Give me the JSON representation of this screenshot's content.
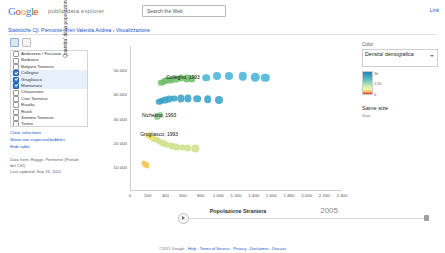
{
  "header": {
    "logo_text": "Google",
    "logo_sub": "public data explorer",
    "search_button": "Search the Web",
    "top_right_link": "Link"
  },
  "breadcrumb": {
    "part1": "Statistiche Cjl: Piemonte, Tren Valentia Andrea",
    "sep": " › ",
    "part2": "Visualizzazione"
  },
  "left_panel": {
    "tools": [
      "grid-view-button",
      "list-view-button"
    ],
    "items": [
      {
        "label": "Andezeno / Fossano",
        "checked": false
      },
      {
        "label": "Barbania",
        "checked": false
      },
      {
        "label": "Bolgaro Torinese",
        "checked": false
      },
      {
        "label": "Collegno",
        "checked": true
      },
      {
        "label": "Grugliasco",
        "checked": true
      },
      {
        "label": "Montanaro",
        "checked": true
      },
      {
        "label": "Chiaverano",
        "checked": false
      },
      {
        "label": "Cirie Torinese",
        "checked": false
      },
      {
        "label": "Rivalta",
        "checked": false
      },
      {
        "label": "Rivoli",
        "checked": false
      },
      {
        "label": "Settimo Torinese",
        "checked": false
      },
      {
        "label": "Torino",
        "checked": false
      },
      {
        "label": "Venaria",
        "checked": false
      }
    ],
    "links": [
      "Clear selections",
      "Show non expected bubbles",
      "Hide table"
    ],
    "data_note_lines": [
      "Data from: Rogge, Piemonte (Portale",
      "del CSI)",
      "Last updated: Sep 16, 2011"
    ]
  },
  "right_panel": {
    "color_label": "Color",
    "selected_metric": "Densita' demografica",
    "legend_min": "0",
    "legend_mid": "1.5k",
    "legend_max": "3k",
    "size_label": "Same size",
    "size_sub": "Size"
  },
  "timeline": {
    "year": "2005",
    "play_button": "play-button"
  },
  "footer": {
    "text": "©2011 Google -",
    "links": [
      "Help",
      "Terms of Service",
      "Privacy",
      "Disclaimer",
      "Discuss"
    ]
  },
  "chart_data": {
    "type": "scatter",
    "title": "",
    "xlabel": "Popolazione Straniera",
    "ylabel": "Quantita' della popolazione totale per comune",
    "xlim": [
      0,
      2400
    ],
    "ylim": [
      0,
      60000
    ],
    "xticks": [
      "0",
      "200",
      "400",
      "600",
      "800",
      "1.000",
      "1.200",
      "1.400",
      "1.600",
      "1.800",
      "2.000",
      "2.200",
      "2.400"
    ],
    "yticks": [
      "10.000",
      "20.000",
      "30.000",
      "40.000",
      "50.000"
    ],
    "grid": false,
    "legend_position": "right",
    "color_scale": "Densita' demografica",
    "annotations": [
      {
        "text": "Collegno, 1993",
        "x": 600,
        "y": 47000
      },
      {
        "text": "Nichelino, 1993",
        "x": 330,
        "y": 31500
      },
      {
        "text": "Grugliasco, 1993",
        "x": 330,
        "y": 23500
      }
    ],
    "series": [
      {
        "name": "Collegno",
        "color": "#6fbf6a",
        "points": [
          {
            "x": 355,
            "y": 44800,
            "r": 3.2
          },
          {
            "x": 380,
            "y": 45200,
            "r": 3.2
          },
          {
            "x": 400,
            "y": 45600,
            "r": 3.2
          },
          {
            "x": 430,
            "y": 45800,
            "r": 3.4
          },
          {
            "x": 470,
            "y": 46000,
            "r": 3.4
          },
          {
            "x": 520,
            "y": 46400,
            "r": 3.4
          },
          {
            "x": 575,
            "y": 46700,
            "r": 3.6
          },
          {
            "x": 640,
            "y": 46600,
            "r": 3.6
          },
          {
            "x": 700,
            "y": 46400,
            "r": 3.6
          }
        ]
      },
      {
        "name": "Collegno-late",
        "color": "#49b5d6",
        "points": [
          {
            "x": 860,
            "y": 46900,
            "r": 3.8
          },
          {
            "x": 980,
            "y": 47400,
            "r": 4.0
          },
          {
            "x": 1120,
            "y": 47500,
            "r": 4.0
          },
          {
            "x": 1280,
            "y": 47400,
            "r": 4.2
          },
          {
            "x": 1420,
            "y": 47100,
            "r": 4.2
          },
          {
            "x": 1530,
            "y": 46900,
            "r": 4.2
          }
        ]
      },
      {
        "name": "Nichelino",
        "color": "#3aa3c8",
        "points": [
          {
            "x": 330,
            "y": 36800,
            "r": 3.2
          },
          {
            "x": 360,
            "y": 37200,
            "r": 3.2
          },
          {
            "x": 395,
            "y": 37600,
            "r": 3.4
          },
          {
            "x": 440,
            "y": 38000,
            "r": 3.4
          },
          {
            "x": 500,
            "y": 38200,
            "r": 3.4
          },
          {
            "x": 575,
            "y": 38300,
            "r": 3.6
          },
          {
            "x": 660,
            "y": 38300,
            "r": 3.6
          },
          {
            "x": 760,
            "y": 38200,
            "r": 3.8
          },
          {
            "x": 880,
            "y": 38000,
            "r": 3.8
          },
          {
            "x": 1010,
            "y": 37800,
            "r": 4.0
          }
        ]
      },
      {
        "name": "Nichelino-low",
        "color": "#8fcf8a",
        "points": [
          {
            "x": 300,
            "y": 30600,
            "r": 3.0
          },
          {
            "x": 320,
            "y": 31000,
            "r": 3.0
          },
          {
            "x": 345,
            "y": 31400,
            "r": 3.0
          }
        ]
      },
      {
        "name": "Grugliasco",
        "color": "#cfe08a",
        "points": [
          {
            "x": 270,
            "y": 21500,
            "r": 3.0
          },
          {
            "x": 300,
            "y": 21000,
            "r": 3.0
          },
          {
            "x": 335,
            "y": 20400,
            "r": 3.2
          },
          {
            "x": 375,
            "y": 19800,
            "r": 3.2
          },
          {
            "x": 420,
            "y": 19200,
            "r": 3.2
          },
          {
            "x": 470,
            "y": 18700,
            "r": 3.4
          },
          {
            "x": 525,
            "y": 18300,
            "r": 3.4
          },
          {
            "x": 590,
            "y": 18000,
            "r": 3.4
          },
          {
            "x": 660,
            "y": 17800,
            "r": 3.6
          },
          {
            "x": 740,
            "y": 17600,
            "r": 3.6
          }
        ]
      },
      {
        "name": "Grugliasco-tail",
        "color": "#f2e06a",
        "points": [
          {
            "x": 200,
            "y": 23200,
            "r": 2.8
          },
          {
            "x": 225,
            "y": 22600,
            "r": 2.8
          },
          {
            "x": 250,
            "y": 22100,
            "r": 2.8
          }
        ]
      },
      {
        "name": "Montanaro",
        "color": "#f5c85a",
        "points": [
          {
            "x": 160,
            "y": 11500,
            "r": 2.6
          },
          {
            "x": 175,
            "y": 11000,
            "r": 2.6
          },
          {
            "x": 190,
            "y": 10600,
            "r": 2.6
          }
        ]
      }
    ]
  }
}
